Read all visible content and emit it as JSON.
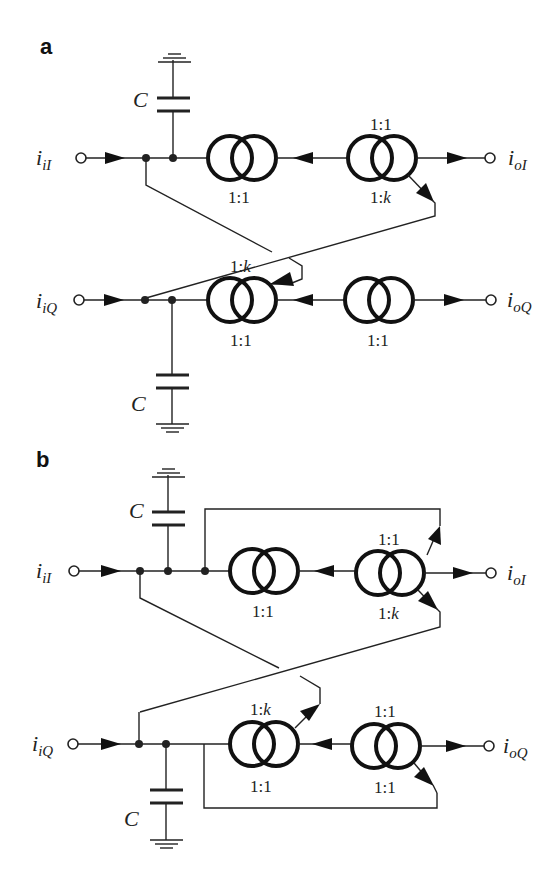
{
  "figure": {
    "panels": [
      {
        "label": "a",
        "rows": {
          "I": {
            "input": "i",
            "input_sub": "iI",
            "output": "i",
            "output_sub": "oI"
          },
          "Q": {
            "input": "i",
            "input_sub": "iQ",
            "output": "i",
            "output_sub": "oQ"
          }
        },
        "capacitor_label": "C",
        "ratios": {
          "I_left_below": "1:1",
          "I_right_above": "1:1",
          "I_right_below_prefix": "1:",
          "I_right_below_k": "k",
          "Q_left_above_prefix": "1:",
          "Q_left_above_k": "k",
          "Q_left_below": "1:1",
          "Q_right_below": "1:1"
        }
      },
      {
        "label": "b",
        "rows": {
          "I": {
            "input": "i",
            "input_sub": "iI",
            "output": "i",
            "output_sub": "oI"
          },
          "Q": {
            "input": "i",
            "input_sub": "iQ",
            "output": "i",
            "output_sub": "oQ"
          }
        },
        "capacitor_label": "C",
        "ratios": {
          "I_left_below": "1:1",
          "I_right_above": "1:1",
          "I_right_below_prefix": "1:",
          "I_right_below_k": "k",
          "Q_left_above_prefix": "1:",
          "Q_left_above_k": "k",
          "Q_left_below": "1:1",
          "Q_right_above": "1:1",
          "Q_right_below": "1:1"
        }
      }
    ],
    "colors": {
      "ink": "#222222",
      "background": "#ffffff"
    }
  }
}
